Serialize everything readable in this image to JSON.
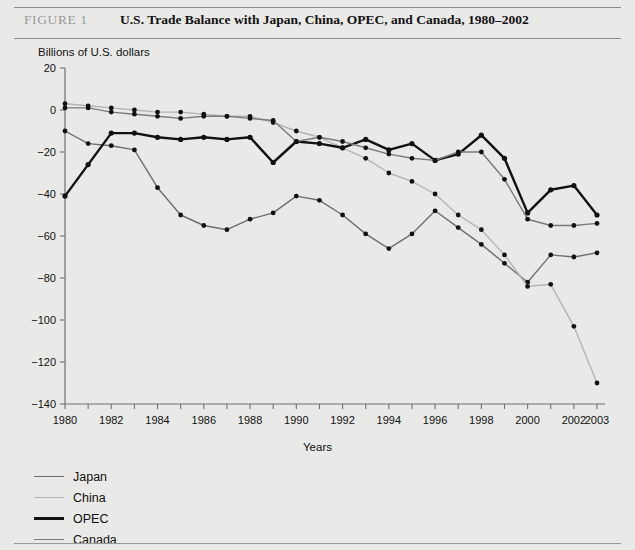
{
  "figure": {
    "label": "FIGURE 1",
    "title": "U.S. Trade Balance with Japan, China, OPEC, and Canada, 1980–2002"
  },
  "chart_data": {
    "type": "line",
    "title": "U.S. Trade Balance with Japan, China, OPEC, and Canada, 1980–2002",
    "subtitle": "Billions of U.S. dollars",
    "xlabel": "Years",
    "ylabel": "Billions of U.S. dollars",
    "xlim": [
      1980,
      2003
    ],
    "ylim": [
      -140,
      20
    ],
    "ytick_step": 20,
    "yticks": [
      20,
      0,
      -20,
      -40,
      -60,
      -80,
      -100,
      -120,
      -140
    ],
    "ytick_labels": [
      "20",
      "0",
      "−20",
      "−40",
      "−60",
      "−80",
      "−100",
      "−120",
      "−140"
    ],
    "x": [
      1980,
      1981,
      1982,
      1983,
      1984,
      1985,
      1986,
      1987,
      1988,
      1989,
      1990,
      1991,
      1992,
      1993,
      1994,
      1995,
      1996,
      1997,
      1998,
      1999,
      2000,
      2001,
      2002,
      2003
    ],
    "xticks": [
      1980,
      1981,
      1982,
      1983,
      1984,
      1985,
      1986,
      1987,
      1988,
      1989,
      1990,
      1991,
      1992,
      1993,
      1994,
      1995,
      1996,
      1997,
      1998,
      1999,
      2000,
      2001,
      2002,
      2003
    ],
    "xtick_labels": [
      "1980",
      "",
      "1982",
      "",
      "1984",
      "",
      "1986",
      "",
      "1988",
      "",
      "1990",
      "",
      "1992",
      "",
      "1994",
      "",
      "1996",
      "",
      "1998",
      "",
      "2000",
      "",
      "2002",
      "2003"
    ],
    "grid": false,
    "markers": true,
    "legend_position": "below-left",
    "series": [
      {
        "name": "Japan",
        "color": "#6e6e6e",
        "width": 1.4,
        "values": [
          -10,
          -16,
          -17,
          -19,
          -37,
          -50,
          -55,
          -57,
          -52,
          -49,
          -41,
          -43,
          -50,
          -59,
          -66,
          -59,
          -48,
          -56,
          -64,
          -73,
          -82,
          -69,
          -70,
          -68
        ]
      },
      {
        "name": "China",
        "color": "#b4b4b4",
        "width": 1.4,
        "values": [
          3,
          2,
          1,
          0,
          -1,
          -1,
          -2,
          -3,
          -3,
          -6,
          -10,
          -13,
          -18,
          -23,
          -30,
          -34,
          -40,
          -50,
          -57,
          -69,
          -84,
          -83,
          -103,
          -130
        ]
      },
      {
        "name": "OPEC",
        "color": "#111111",
        "width": 2.4,
        "values": [
          -41,
          -26,
          -11,
          -11,
          -13,
          -14,
          -13,
          -14,
          -13,
          -25,
          -15,
          -16,
          -18,
          -14,
          -19,
          -16,
          -24,
          -21,
          -12,
          -23,
          -49,
          -38,
          -36,
          -50
        ]
      },
      {
        "name": "Canada",
        "color": "#7a7a7a",
        "width": 1.4,
        "values": [
          1,
          1,
          -1,
          -2,
          -3,
          -4,
          -3,
          -3,
          -4,
          -5,
          -15,
          -13,
          -15,
          -18,
          -21,
          -23,
          -24,
          -20,
          -20,
          -33,
          -52,
          -55,
          -55,
          -54
        ]
      }
    ]
  },
  "legend": {
    "items": [
      {
        "label": "Japan"
      },
      {
        "label": "China"
      },
      {
        "label": "OPEC"
      },
      {
        "label": "Canada"
      }
    ]
  }
}
